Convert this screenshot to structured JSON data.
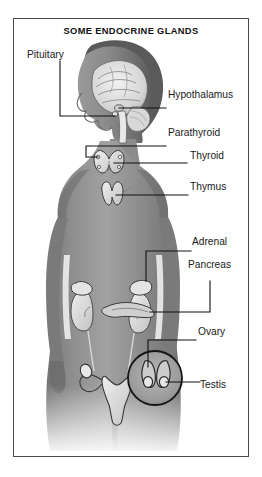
{
  "figure": {
    "title": "SOME ENDOCRINE GLANDS",
    "colors": {
      "frame": "#4a4a4a",
      "background": "#ffffff",
      "body_dark": "#6e6e6e",
      "body_mid": "#8f8f8f",
      "body_light": "#bdbdbd",
      "label_text": "#1a1a1a",
      "leader_line": "#111111"
    }
  },
  "labels": [
    {
      "id": "pituitary",
      "text": "Pituitary",
      "side": "left"
    },
    {
      "id": "hypothalamus",
      "text": "Hypothalamus",
      "side": "right"
    },
    {
      "id": "parathyroid",
      "text": "Parathyroid",
      "side": "right"
    },
    {
      "id": "thyroid",
      "text": "Thyroid",
      "side": "right"
    },
    {
      "id": "thymus",
      "text": "Thymus",
      "side": "right"
    },
    {
      "id": "adrenal",
      "text": "Adrenal",
      "side": "right"
    },
    {
      "id": "pancreas",
      "text": "Pancreas",
      "side": "right"
    },
    {
      "id": "ovary",
      "text": "Ovary",
      "side": "right"
    },
    {
      "id": "testis",
      "text": "Testis",
      "side": "right"
    }
  ],
  "inset": {
    "id": "testis-inset",
    "shape": "circle",
    "content": "testes-detail"
  }
}
